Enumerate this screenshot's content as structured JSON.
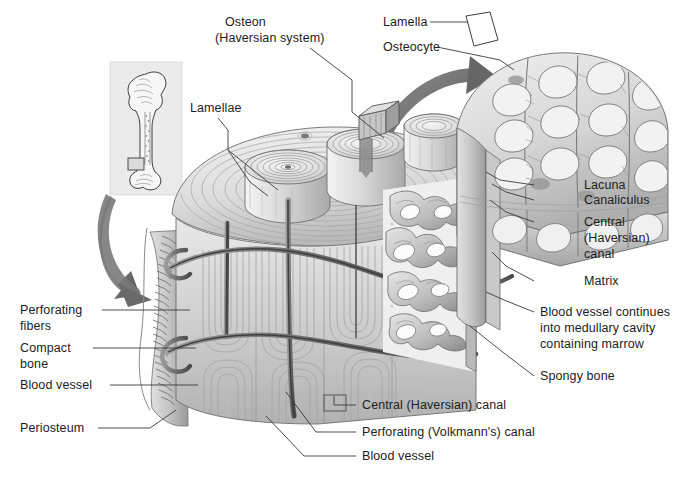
{
  "figure": {
    "background_color": "#ffffff",
    "ink_color": "#1d1d1d",
    "shade_light": "#ececec",
    "shade_mid": "#c9c9c9",
    "shade_dark": "#8e8e8e",
    "shade_darkest": "#5e5e5e"
  },
  "labels": {
    "osteon_line1": "Osteon",
    "osteon_line2": "(Haversian system)",
    "lamellae": "Lamellae",
    "lamella": "Lamella",
    "osteocyte": "Osteocyte",
    "lacuna": "Lacuna",
    "canaliculus": "Canaliculus",
    "central_line1": "Central",
    "central_line2": "(Haversian)",
    "central_line3": "canal",
    "matrix": "Matrix",
    "bloodvessel_medullary_line1": "Blood vessel continues",
    "bloodvessel_medullary_line2": "into medullary cavity",
    "bloodvessel_medullary_line3": "containing marrow",
    "spongy_bone": "Spongy bone",
    "perforating_fibers_line1": "Perforating",
    "perforating_fibers_line2": "fibers",
    "compact_bone_line1": "Compact",
    "compact_bone_line2": "bone",
    "blood_vessel_left": "Blood vessel",
    "periosteum": "Periosteum",
    "central_haversian_canal": "Central (Haversian) canal",
    "perforating_volkmanns_canal": "Perforating (Volkmann's) canal",
    "blood_vessel_bottom": "Blood vessel"
  },
  "illustration": {
    "femur_inset_name": "femur-inset",
    "main_block_name": "compact-bone-wedge",
    "magnified_block_name": "osteocyte-lamella-magnification",
    "spongy_region_name": "spongy-bone-region",
    "arrow_lower_name": "magnify-arrow-femur-to-block",
    "arrow_upper_name": "magnify-arrow-block-to-osteocyte"
  }
}
